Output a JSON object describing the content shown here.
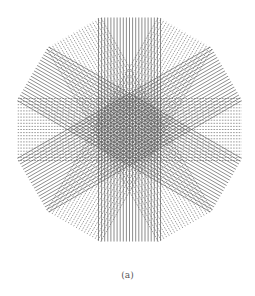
{
  "figure": {
    "caption": "(a)",
    "center": [
      129.5,
      129.5
    ],
    "outline": {
      "sides": 12,
      "radius": 116,
      "rotation_deg": 15
    },
    "line_color": "#555555",
    "band": {
      "width": 62,
      "lines": 21
    },
    "families": [
      {
        "angle_deg": 0,
        "style": "dashed"
      },
      {
        "angle_deg": 30,
        "style": "solid"
      },
      {
        "angle_deg": 60,
        "style": "dashed"
      },
      {
        "angle_deg": 90,
        "style": "solid"
      },
      {
        "angle_deg": 120,
        "style": "dashed"
      },
      {
        "angle_deg": 150,
        "style": "solid"
      }
    ]
  }
}
